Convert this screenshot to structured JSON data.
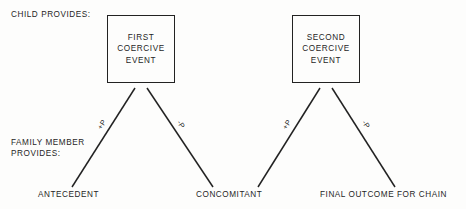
{
  "diagram": {
    "row_labels": {
      "child": "CHILD PROVIDES:",
      "family_line1": "FAMILY MEMBER",
      "family_line2": "PROVIDES:"
    },
    "boxes": [
      {
        "id": "first-coercive-event",
        "line1": "FIRST",
        "line2": "COERCIVE",
        "line3": "EVENT",
        "x": 107,
        "y": 15,
        "w": 68,
        "h": 68
      },
      {
        "id": "second-coercive-event",
        "line1": "SECOND",
        "line2": "COERCIVE",
        "line3": "EVENT",
        "x": 292,
        "y": 15,
        "w": 68,
        "h": 68
      }
    ],
    "branches": [
      {
        "id": "first-left",
        "label": "+P",
        "x1": 135,
        "y1": 88,
        "x2": 72,
        "y2": 187,
        "lx": 103,
        "ly": 124,
        "rot": -57
      },
      {
        "id": "first-right",
        "label": "-P",
        "x1": 147,
        "y1": 88,
        "x2": 213,
        "y2": 187,
        "lx": 183,
        "ly": 124,
        "rot": 57
      },
      {
        "id": "second-left",
        "label": "+P",
        "x1": 320,
        "y1": 88,
        "x2": 258,
        "y2": 187,
        "lx": 288,
        "ly": 124,
        "rot": -57
      },
      {
        "id": "second-right",
        "label": "-P",
        "x1": 332,
        "y1": 88,
        "x2": 395,
        "y2": 187,
        "lx": 368,
        "ly": 124,
        "rot": 57
      }
    ],
    "outcomes": [
      {
        "id": "antecedent",
        "text": "ANTECEDENT",
        "x": 38,
        "y": 190
      },
      {
        "id": "concomitant",
        "text": "CONCOMITANT",
        "x": 196,
        "y": 190
      },
      {
        "id": "final",
        "text": "FINAL OUTCOME FOR CHAIN",
        "x": 320,
        "y": 190
      }
    ],
    "colors": {
      "ink": "#1f1f1f",
      "line": "#222222",
      "background": "#fdfdfc"
    }
  }
}
